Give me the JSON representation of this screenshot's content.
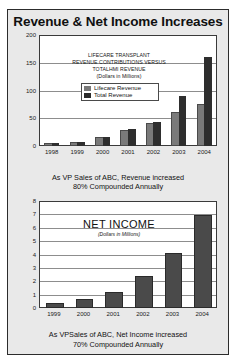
{
  "slide": {
    "title": "Revenue & Net Income Increases",
    "background_color": "#e9e9e9",
    "border_color": "#2c2c2c"
  },
  "captions": {
    "revenue_line1": "As VP Sales of ABC, Revenue increased",
    "revenue_line2": "80% Compounded Annually",
    "net_income_line1": "As VPSales of ABC, Net Income increased",
    "net_income_line2": "70% Compounded Annually"
  },
  "chart_data": [
    {
      "id": "revenue",
      "type": "bar",
      "title": "",
      "annotation_line1": "LIFECARE TRANSPLANT",
      "annotation_line2": "REVENUE CONTRIBUTIONS VERSUS",
      "annotation_line3": "TOTALHMI  REVENUE",
      "annotation_line4": "(Dollars in Millions)",
      "categories": [
        "1998",
        "1999",
        "2000",
        "2001",
        "2002",
        "2003",
        "2004"
      ],
      "series": [
        {
          "name": "Lifecare Revenue",
          "color": "#7a7a7a",
          "values": [
            2,
            4,
            12,
            25,
            38,
            57,
            72
          ]
        },
        {
          "name": "Total Revenue",
          "color": "#2e2e2e",
          "values": [
            6,
            8,
            16,
            30,
            43,
            90,
            160
          ]
        }
      ],
      "ylim": [
        0,
        200
      ],
      "yticks": [
        "0",
        "50",
        "100",
        "150",
        "200"
      ],
      "xlabel": "",
      "ylabel": "",
      "grid": true,
      "legend_position": "inside-center"
    },
    {
      "id": "net-income",
      "type": "bar",
      "title": "NET INCOME",
      "subtitle": "(Dollars in Millions)",
      "categories": [
        "1999",
        "2000",
        "2001",
        "2002",
        "2003",
        "2004"
      ],
      "series": [
        {
          "name": "Net Income",
          "color": "#4a4a4a",
          "values": [
            0.2,
            0.5,
            1.05,
            2.25,
            4.0,
            6.8
          ]
        }
      ],
      "ylim": [
        0,
        8
      ],
      "yticks": [
        "0",
        "1",
        "2",
        "3",
        "4",
        "5",
        "6",
        "7",
        "8"
      ],
      "xlabel": "",
      "ylabel": "",
      "grid": true,
      "legend_position": "none"
    }
  ]
}
